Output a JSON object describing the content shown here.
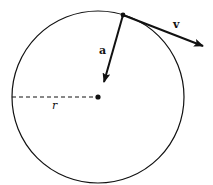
{
  "diagram": {
    "labels": {
      "velocity": "v",
      "acceleration": "a",
      "radius": "r"
    },
    "colors": {
      "stroke": "#111111",
      "background": "#ffffff"
    }
  }
}
